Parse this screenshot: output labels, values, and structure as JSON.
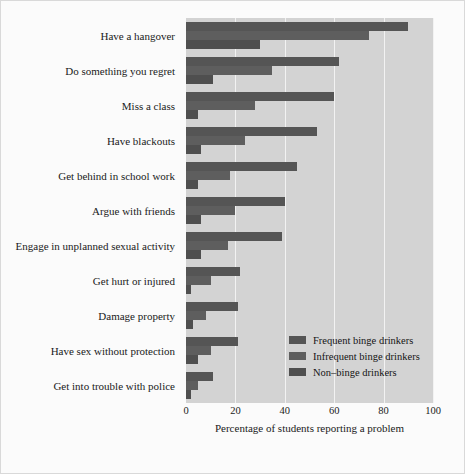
{
  "chart_data": {
    "type": "bar",
    "orientation": "horizontal",
    "title": "",
    "xlabel": "Percentage of students reporting a problem",
    "ylabel": "",
    "xlim": [
      0,
      100
    ],
    "xticks": [
      0,
      20,
      40,
      60,
      80,
      100
    ],
    "grid": true,
    "legend_position": "inside-lower-right",
    "categories": [
      "Have a hangover",
      "Do something you regret",
      "Miss a class",
      "Have blackouts",
      "Get behind in school work",
      "Argue with friends",
      "Engage in unplanned sexual activity",
      "Get hurt or injured",
      "Damage property",
      "Have sex without protection",
      "Get into trouble with police"
    ],
    "series": [
      {
        "name": "Frequent binge drinkers",
        "color": "#555555",
        "values": [
          90,
          62,
          60,
          53,
          45,
          40,
          39,
          22,
          21,
          21,
          11
        ]
      },
      {
        "name": "Infrequent binge drinkers",
        "color": "#5e5e5e",
        "values": [
          74,
          35,
          28,
          24,
          18,
          20,
          17,
          10,
          8,
          10,
          5
        ]
      },
      {
        "name": "Non–binge drinkers",
        "color": "#4f4f4f",
        "values": [
          30,
          11,
          5,
          6,
          5,
          6,
          6,
          2,
          3,
          5,
          2
        ]
      }
    ]
  },
  "legend": {
    "items": [
      {
        "label": "Frequent binge drinkers"
      },
      {
        "label": "Infrequent binge drinkers"
      },
      {
        "label": "Non–binge drinkers"
      }
    ]
  },
  "axis": {
    "x_title": "Percentage of students reporting a problem",
    "tick_labels": [
      "0",
      "20",
      "40",
      "60",
      "80",
      "100"
    ]
  },
  "colors": {
    "panel_background": "#d3d3d3",
    "figure_background": "#fbfbfb",
    "gridline": "#f2f2f2",
    "text": "#1a1a1a"
  }
}
